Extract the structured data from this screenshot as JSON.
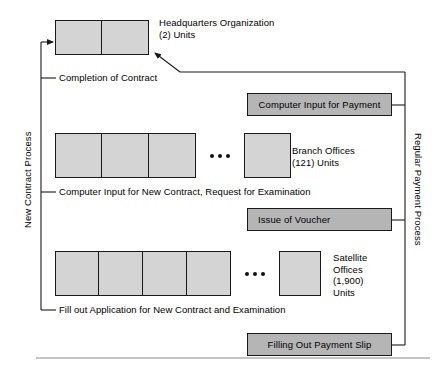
{
  "diagram": {
    "colors": {
      "unit_fill": "#d4d4d4",
      "process_fill": "#b5b5b5",
      "line": "#1a1a1a",
      "background": "#ffffff"
    },
    "flow_labels": {
      "left_axis": "New Contract Process",
      "right_axis": "Regular Payment Process"
    },
    "organization_rows": [
      {
        "id": "headquarters",
        "name": "Headquarters Organization",
        "count_label": "(2) Units",
        "caption": "Headquarters Organization\n(2) Units",
        "grouped_cells": 2,
        "has_ellipsis": false,
        "trailing_cells": 0,
        "step_label": "Completion of Contract"
      },
      {
        "id": "branch-offices",
        "name": "Branch Offices",
        "count_label": "(121) Units",
        "caption": "Branch Offices\n(121) Units",
        "grouped_cells": 3,
        "has_ellipsis": true,
        "trailing_cells": 1,
        "step_label": "Computer Input for New Contract, Request for Examination"
      },
      {
        "id": "satellite-offices",
        "name": "Satellite Offices",
        "count_label": "(1,900) Units",
        "caption": "Satellite\nOffices\n(1,900)\nUnits",
        "grouped_cells": 4,
        "has_ellipsis": true,
        "trailing_cells": 1,
        "step_label": "Fill out Application for New Contract and Examination"
      }
    ],
    "process_steps": [
      {
        "id": "computer-input-for-payment",
        "label": "Computer Input for Payment",
        "align": "center"
      },
      {
        "id": "issue-of-voucher",
        "label": "Issue of Voucher",
        "align": "left"
      },
      {
        "id": "filling-out-payment-slip",
        "label": "Filling Out Payment Slip",
        "align": "center"
      }
    ]
  }
}
